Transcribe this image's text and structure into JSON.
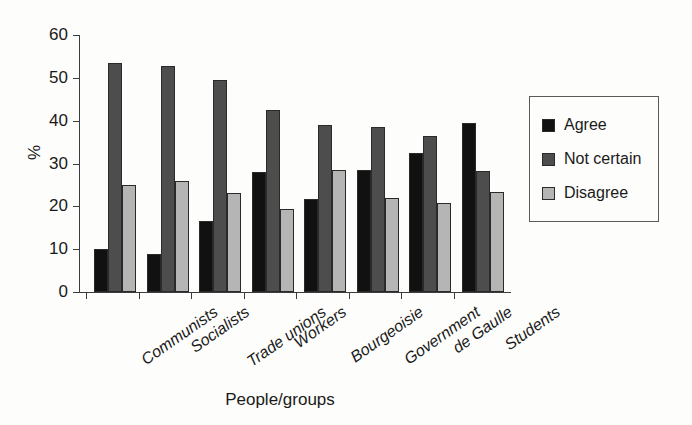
{
  "chart_data": {
    "type": "bar",
    "title": "",
    "xlabel": "People/groups",
    "ylabel": "%",
    "ylim": [
      0,
      60
    ],
    "yticks": [
      0,
      10,
      20,
      30,
      40,
      50,
      60
    ],
    "grid": false,
    "legend_position": "right",
    "categories": [
      "Communists",
      "Socialists",
      "Trade unions",
      "Workers",
      "Bourgeoisie",
      "Government",
      "de Gaulle",
      "Students"
    ],
    "series": [
      {
        "name": "Agree",
        "color": "#111111",
        "values": [
          10.0,
          8.9,
          16.5,
          28.1,
          21.7,
          28.6,
          32.4,
          39.4
        ]
      },
      {
        "name": "Not certain",
        "color": "#4d4d4d",
        "values": [
          53.4,
          52.8,
          49.5,
          42.5,
          39.0,
          38.6,
          36.5,
          28.3
        ]
      },
      {
        "name": "Disagree",
        "color": "#b5b5b5",
        "values": [
          25.0,
          25.9,
          23.0,
          19.3,
          28.6,
          22.0,
          20.7,
          23.3
        ]
      }
    ]
  },
  "legend": {
    "items": [
      {
        "label": "Agree",
        "color": "#111111"
      },
      {
        "label": "Not certain",
        "color": "#4d4d4d"
      },
      {
        "label": "Disagree",
        "color": "#b5b5b5"
      }
    ]
  },
  "axes": {
    "y_title": "%",
    "x_title": "People/groups",
    "y_tick_labels": [
      "0",
      "10",
      "20",
      "30",
      "40",
      "50",
      "60"
    ]
  }
}
